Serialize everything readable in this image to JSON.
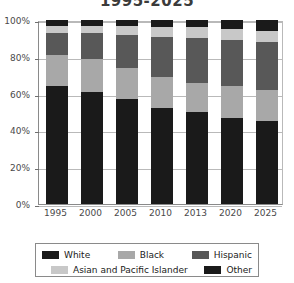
{
  "chart_data": {
    "type": "bar",
    "subtype": "stacked-percentage-column",
    "title": "1995-2025",
    "xlabel": "",
    "ylabel": "",
    "categories": [
      "1995",
      "2000",
      "2005",
      "2010",
      "2013",
      "2020",
      "2025"
    ],
    "ylim": [
      0,
      100
    ],
    "ytick_labels": [
      "0%",
      "20%",
      "40%",
      "60%",
      "80%",
      "100%"
    ],
    "ytick_values": [
      0,
      20,
      40,
      60,
      80,
      100
    ],
    "grid": true,
    "legend_position": "bottom",
    "stack_order_bottom_to_top": [
      "White",
      "Black",
      "Hispanic",
      "Asian and Pacific Islander",
      "Other"
    ],
    "series": [
      {
        "name": "White",
        "color": "#1a1a1a",
        "values": [
          64,
          61,
          57,
          52,
          50,
          47,
          45
        ]
      },
      {
        "name": "Black",
        "color": "#a8a8a8",
        "values": [
          17,
          18,
          17,
          17,
          16,
          17,
          17
        ]
      },
      {
        "name": "Hispanic",
        "color": "#585858",
        "values": [
          12,
          14,
          18,
          22,
          24,
          25,
          26
        ]
      },
      {
        "name": "Asian and Pacific Islander",
        "color": "#c8c8c8",
        "values": [
          4,
          4,
          5,
          5,
          6,
          6,
          6
        ]
      },
      {
        "name": "Other",
        "color": "#1a1a1a",
        "values": [
          3,
          3,
          3,
          4,
          4,
          5,
          6
        ]
      }
    ]
  },
  "legend": {
    "row1": [
      {
        "label": "White",
        "color": "#1a1a1a"
      },
      {
        "label": "Black",
        "color": "#a8a8a8"
      },
      {
        "label": "Hispanic",
        "color": "#585858"
      }
    ],
    "row2": [
      {
        "label": "Asian and Pacific Islander",
        "color": "#c8c8c8"
      },
      {
        "label": "Other",
        "color": "#1a1a1a"
      }
    ]
  }
}
